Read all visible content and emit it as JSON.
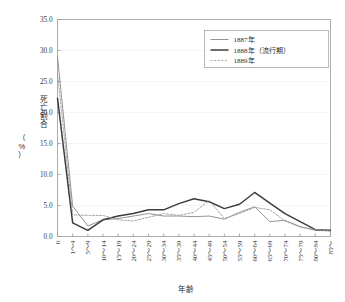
{
  "chart_data": {
    "type": "line",
    "title": "",
    "xlabel": "年齢",
    "ylabel": "死亡割合（%）",
    "ylabel_line1": "死亡割合",
    "ylabel_line2": "（%）",
    "ylim": [
      0.0,
      35.0
    ],
    "ytick_step": 5.0,
    "grid": true,
    "legend_position": "top-right",
    "ytick_labels": [
      "0.0",
      "5.0",
      "10.0",
      "15.0",
      "20.0",
      "25.0",
      "30.0",
      "35.0"
    ],
    "ytick_values": [
      0.0,
      5.0,
      10.0,
      15.0,
      20.0,
      25.0,
      30.0,
      35.0
    ],
    "categories": [
      "0",
      "1～4",
      "5～9",
      "10～14",
      "15～19",
      "20～24",
      "25～29",
      "30～34",
      "35～39",
      "40～44",
      "45～49",
      "50～54",
      "55～59",
      "60～64",
      "65～69",
      "70～74",
      "75～79",
      "80～84",
      "85～"
    ],
    "series": [
      {
        "name": "1887年",
        "color": "#888888",
        "width": 0.9,
        "dash": "none",
        "values": [
          29.0,
          4.9,
          1.7,
          2.7,
          2.9,
          3.3,
          3.7,
          3.3,
          3.3,
          3.2,
          3.3,
          2.8,
          3.9,
          4.8,
          2.4,
          2.6,
          1.6,
          1.0,
          0.9
        ]
      },
      {
        "name": "1888年（流行期）",
        "color": "#3c3c3c",
        "width": 1.5,
        "dash": "none",
        "values": [
          22.3,
          2.2,
          1.0,
          2.7,
          3.3,
          3.7,
          4.3,
          4.3,
          5.3,
          6.1,
          5.6,
          4.5,
          5.2,
          7.1,
          5.4,
          3.7,
          2.4,
          1.1,
          1.0
        ]
      },
      {
        "name": "1889年",
        "color": "#9a9a9a",
        "width": 0.9,
        "dash": "2,1.6",
        "values": [
          26.3,
          3.5,
          3.4,
          3.4,
          2.7,
          2.5,
          3.1,
          3.7,
          3.4,
          3.9,
          5.8,
          2.9,
          3.7,
          4.7,
          4.3,
          2.5,
          1.5,
          1.1,
          0.9
        ]
      }
    ]
  },
  "legend": {
    "items": [
      {
        "label": "1887年"
      },
      {
        "label": "1888年（流行期）"
      },
      {
        "label": "1889年"
      }
    ]
  }
}
